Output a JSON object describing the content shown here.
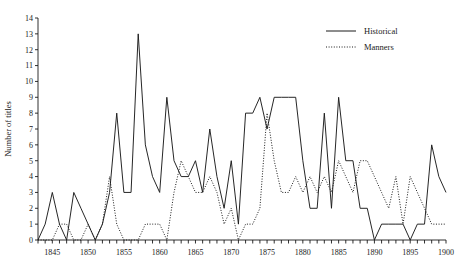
{
  "chart_data": {
    "type": "line",
    "title": "",
    "xlabel": "",
    "ylabel": "Number of titles",
    "xlim": [
      1843,
      1900
    ],
    "ylim": [
      0,
      14
    ],
    "ytick_step": 1,
    "xtick_step": 1,
    "xtick_label_step": 5,
    "grid": false,
    "legend_position": "top-right",
    "yticks": [
      0,
      1,
      2,
      3,
      4,
      5,
      6,
      7,
      8,
      9,
      10,
      11,
      12,
      13,
      14
    ],
    "ytick_labels": [
      "0",
      "1",
      "2",
      "3",
      "4",
      "5",
      "6",
      "7",
      "8",
      "9",
      "10",
      "11",
      "12",
      "13",
      "14"
    ],
    "xticks": [
      1843,
      1844,
      1845,
      1846,
      1847,
      1848,
      1849,
      1850,
      1851,
      1852,
      1853,
      1854,
      1855,
      1856,
      1857,
      1858,
      1859,
      1860,
      1861,
      1862,
      1863,
      1864,
      1865,
      1866,
      1867,
      1868,
      1869,
      1870,
      1871,
      1872,
      1873,
      1874,
      1875,
      1876,
      1877,
      1878,
      1879,
      1880,
      1881,
      1882,
      1883,
      1884,
      1885,
      1886,
      1887,
      1888,
      1889,
      1890,
      1891,
      1892,
      1893,
      1894,
      1895,
      1896,
      1897,
      1898,
      1899,
      1900
    ],
    "xtick_labels": [
      "1845",
      "1850",
      "1855",
      "1860",
      "1865",
      "1870",
      "1875",
      "1880",
      "1885",
      "1890",
      "1895",
      "1900"
    ],
    "xtick_label_values": [
      1845,
      1850,
      1855,
      1860,
      1865,
      1870,
      1875,
      1880,
      1885,
      1890,
      1895,
      1900
    ],
    "x": [
      1843,
      1844,
      1845,
      1846,
      1847,
      1848,
      1849,
      1850,
      1851,
      1852,
      1853,
      1854,
      1855,
      1856,
      1857,
      1858,
      1859,
      1860,
      1861,
      1862,
      1863,
      1864,
      1865,
      1866,
      1867,
      1868,
      1869,
      1870,
      1871,
      1872,
      1873,
      1874,
      1875,
      1876,
      1877,
      1878,
      1879,
      1880,
      1881,
      1882,
      1883,
      1884,
      1885,
      1886,
      1887,
      1888,
      1889,
      1890,
      1891,
      1892,
      1893,
      1894,
      1895,
      1896,
      1897,
      1898,
      1899,
      1900
    ],
    "series": [
      {
        "name": "Historical",
        "style": "solid",
        "color": "#1a1a1a",
        "values": [
          0,
          1,
          3,
          1,
          0,
          3,
          2,
          1,
          0,
          1,
          3,
          8,
          3,
          3,
          13,
          6,
          4,
          3,
          9,
          5,
          4,
          4,
          5,
          3,
          7,
          4,
          2,
          5,
          1,
          8,
          8,
          9,
          7,
          9,
          9,
          9,
          9,
          5,
          2,
          2,
          8,
          2,
          9,
          5,
          5,
          2,
          2,
          0,
          1,
          1,
          1,
          1,
          0,
          1,
          1,
          6,
          4,
          3
        ]
      },
      {
        "name": "Manners",
        "style": "dotted",
        "color": "#1a1a1a",
        "values": [
          0,
          0,
          0,
          1,
          1,
          0,
          0,
          1,
          0,
          1,
          4,
          1,
          0,
          0,
          0,
          1,
          1,
          1,
          0,
          3,
          5,
          4,
          3,
          3,
          4,
          3,
          1,
          2,
          0,
          1,
          1,
          2,
          8,
          5,
          3,
          3,
          4,
          3,
          4,
          3,
          4,
          3,
          5,
          4,
          3,
          5,
          5,
          4,
          3,
          2,
          4,
          1,
          4,
          3,
          2,
          1,
          1,
          1
        ]
      }
    ]
  },
  "legend": {
    "entries": [
      {
        "label": "Historical",
        "style": "solid"
      },
      {
        "label": "Manners",
        "style": "dotted"
      }
    ]
  },
  "axes": {
    "y_title": "Number of titles"
  }
}
